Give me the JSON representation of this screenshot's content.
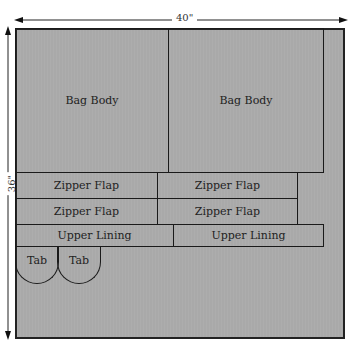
{
  "diagram": {
    "title_partial": "Cutting Diagram",
    "width_dimension": "40\"",
    "height_dimension": "36\"",
    "pieces": {
      "bag_body_1": "Bag Body",
      "bag_body_2": "Bag Body",
      "zipper_flap_1": "Zipper Flap",
      "zipper_flap_2": "Zipper Flap",
      "zipper_flap_3": "Zipper Flap",
      "zipper_flap_4": "Zipper Flap",
      "upper_lining_1": "Upper Lining",
      "upper_lining_2": "Upper Lining",
      "tab_1": "Tab",
      "tab_2": "Tab"
    },
    "colors": {
      "fabric": "#a9a9a9",
      "outline": "#1a1a1a"
    }
  }
}
